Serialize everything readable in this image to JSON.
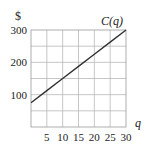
{
  "chart_data": {
    "type": "line",
    "title": "",
    "xlabel": "q",
    "ylabel": "$",
    "xlim": [
      0,
      30
    ],
    "ylim": [
      0,
      300
    ],
    "grid": true,
    "x_ticks": [
      5,
      10,
      15,
      20,
      25,
      30
    ],
    "y_ticks": [
      100,
      200,
      300
    ],
    "x_grid_step": 5,
    "y_grid_step": 50,
    "series": [
      {
        "name": "C(q)",
        "label": "C(q)",
        "x": [
          0,
          5,
          10,
          15,
          20,
          25,
          30
        ],
        "values": [
          75,
          112.5,
          150,
          187.5,
          225,
          262.5,
          300
        ]
      }
    ],
    "annotations": [
      {
        "text": "C(q)",
        "x": 27,
        "y": 315
      }
    ]
  },
  "labels": {
    "y_axis": "$",
    "x_axis": "q",
    "curve": "C(q)"
  }
}
